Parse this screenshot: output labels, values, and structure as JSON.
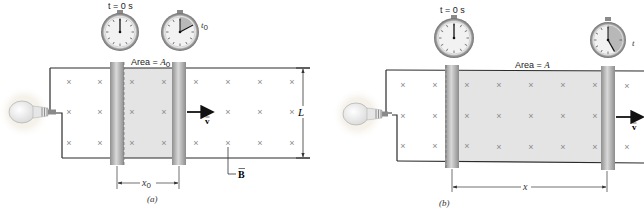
{
  "panel_a": {
    "caption": "(a)",
    "clock_start_label": "t = 0 s",
    "clock_end_label_main": "t",
    "clock_end_label_sub": "0",
    "area_label_prefix": "Area = ",
    "area_label_var": "A",
    "area_label_sub": "0",
    "velocity_label": "v",
    "length_label": "L",
    "field_label": "B",
    "displacement_label_main": "x",
    "displacement_label_sub": "0"
  },
  "panel_b": {
    "caption": "(b)",
    "clock_start_label": "t = 0 s",
    "clock_end_label": "t",
    "area_label_prefix": "Area = ",
    "area_label_var": "A",
    "velocity_label": "v",
    "displacement_label": "x"
  },
  "field_symbol": "×",
  "colors": {
    "wire": "#2b2b2b",
    "shaded_area": "#e4e4e4",
    "rod": "#a9a9a9",
    "rod_highlight": "#d6d6d6",
    "field_mark": "#8a8a8a",
    "clock_rim": "#9a9a9a",
    "clock_wedge": "#b8b8b8",
    "bulb_glow": "#f3efe6"
  }
}
